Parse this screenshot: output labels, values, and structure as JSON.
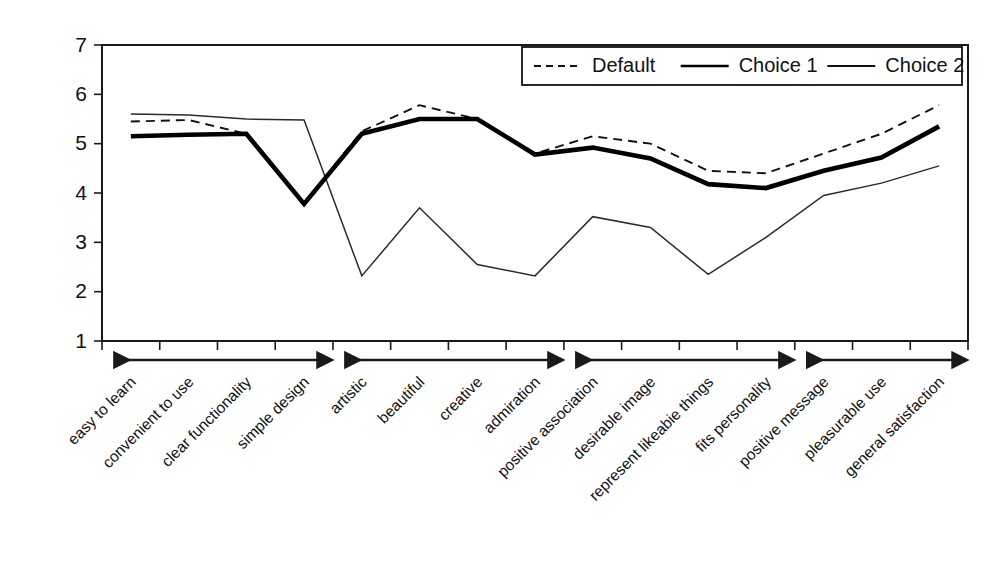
{
  "chart_data": {
    "type": "line",
    "title": "",
    "subtitle": "",
    "xlabel": "",
    "ylabel": "",
    "ylim": [
      1,
      7
    ],
    "yticks": [
      1,
      2,
      3,
      4,
      5,
      6,
      7
    ],
    "grid": false,
    "legend_position": "top-right",
    "categories": [
      "easy to learn",
      "convenient to use",
      "clear functionality",
      "simple design",
      "artistic",
      "beautiful",
      "creative",
      "admiration",
      "positive association",
      "desirable image",
      "represent likeabie things",
      "fits personality",
      "positive message",
      "pleasurable use",
      "general satisfaction"
    ],
    "series": [
      {
        "name": "Default",
        "style": "dashed",
        "values": [
          5.45,
          5.48,
          5.2,
          3.8,
          5.25,
          5.78,
          5.5,
          4.8,
          5.15,
          5.0,
          4.45,
          4.4,
          4.8,
          5.2,
          5.78
        ]
      },
      {
        "name": "Choice 1",
        "style": "thick-solid",
        "values": [
          5.15,
          5.18,
          5.2,
          3.78,
          5.2,
          5.5,
          5.5,
          4.78,
          4.92,
          4.7,
          4.18,
          4.1,
          4.45,
          4.72,
          5.35
        ]
      },
      {
        "name": "Choice 2",
        "style": "thin-solid",
        "values": [
          5.6,
          5.58,
          5.5,
          5.48,
          2.32,
          3.7,
          2.55,
          2.32,
          3.52,
          3.3,
          2.35,
          3.1,
          3.95,
          4.2,
          4.55
        ]
      }
    ],
    "group_brackets": [
      {
        "label": "",
        "start_index": 0,
        "end_index": 3
      },
      {
        "label": "",
        "start_index": 4,
        "end_index": 7
      },
      {
        "label": "",
        "start_index": 8,
        "end_index": 11
      },
      {
        "label": "",
        "start_index": 12,
        "end_index": 14
      }
    ],
    "colors": {
      "default_series": "#111111",
      "choice1_series": "#000000",
      "choice2_series": "#2b2b2b",
      "axis": "#1a1a1a",
      "background": "#ffffff"
    }
  },
  "legend": {
    "items": [
      {
        "label": "Default",
        "style": "dashed"
      },
      {
        "label": "Choice 1",
        "style": "thick-solid"
      },
      {
        "label": "Choice 2",
        "style": "thin-solid"
      }
    ]
  }
}
